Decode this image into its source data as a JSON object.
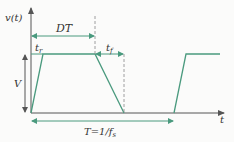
{
  "diagram": {
    "type": "trapezoidal pulse waveform",
    "colors": {
      "waveform": "#4a9a7e",
      "axis": "#555555",
      "arrow": "#4a9a7e",
      "dashed": "#888888",
      "text": "#333333"
    },
    "labels": {
      "y_axis": "v(t)",
      "x_axis": "t",
      "duty": "DT",
      "rise": "t",
      "rise_sub": "r",
      "fall": "t",
      "fall_sub": "f",
      "amplitude": "V",
      "period": "T=1/f",
      "period_sub": "s"
    }
  }
}
